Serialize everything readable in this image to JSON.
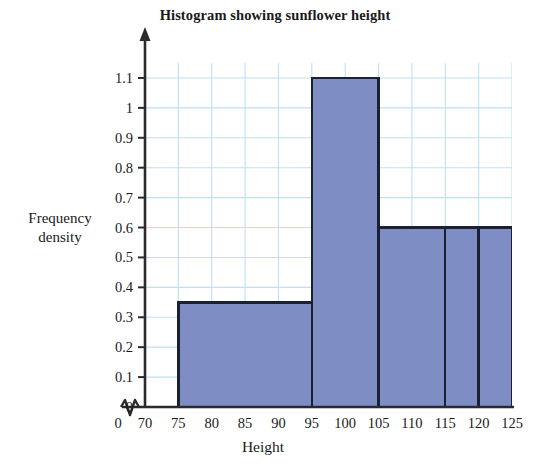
{
  "chart_data": {
    "type": "bar",
    "title": "Histogram showing sunflower height",
    "xlabel": "Height",
    "ylabel": "Frequency\ndensity",
    "ylabel_lines": [
      "Frequency",
      "density"
    ],
    "xlim": [
      70,
      125
    ],
    "ylim": [
      0,
      1.15
    ],
    "grid": true,
    "legend": null,
    "axis_break": true,
    "axis_break_note": "zigzag break between 0 and 70 on x-axis",
    "bin_edges": [
      75,
      95,
      105,
      115,
      120,
      125
    ],
    "categories": [
      "75-95",
      "95-105",
      "105-115",
      "115-120",
      "120-125"
    ],
    "values": [
      0.35,
      1.1,
      0.6,
      0.6,
      0.6
    ],
    "bars": [
      {
        "start": 75,
        "end": 95,
        "frequency_density": 0.35,
        "width": 20,
        "frequency": 7
      },
      {
        "start": 95,
        "end": 105,
        "frequency_density": 1.1,
        "width": 10,
        "frequency": 11
      },
      {
        "start": 105,
        "end": 115,
        "frequency_density": 0.6,
        "width": 10,
        "frequency": 6
      },
      {
        "start": 115,
        "end": 120,
        "frequency_density": 0.6,
        "width": 5,
        "frequency": 3
      },
      {
        "start": 120,
        "end": 125,
        "frequency_density": 0.6,
        "width": 5,
        "frequency": 3
      }
    ],
    "ytick_labels": [
      "0",
      "0.1",
      "0.2",
      "0.3",
      "0.4",
      "0.5",
      "0.6",
      "0.7",
      "0.8",
      "0.9",
      "1",
      "1.1"
    ],
    "ytick_values": [
      0,
      0.1,
      0.2,
      0.3,
      0.4,
      0.5,
      0.6,
      0.7,
      0.8,
      0.9,
      1.0,
      1.1
    ],
    "xtick_labels": [
      "0",
      "70",
      "75",
      "80",
      "85",
      "90",
      "95",
      "100",
      "105",
      "110",
      "115",
      "120",
      "125"
    ],
    "xtick_values": [
      0,
      70,
      75,
      80,
      85,
      90,
      95,
      100,
      105,
      110,
      115,
      120,
      125
    ],
    "colors": {
      "bar_fill": "#7e8ec4",
      "bar_stroke": "#1b2033",
      "grid": "#bfe0f2",
      "axis": "#2b2b2b",
      "background": "#ffffff",
      "text": "#1a1a1a"
    }
  }
}
